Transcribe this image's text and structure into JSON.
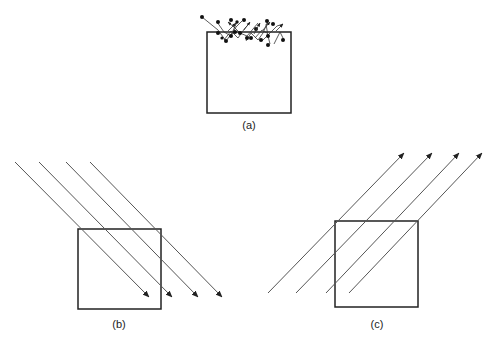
{
  "panels": [
    {
      "id": "a",
      "label": "(a)",
      "description": "particles scattering at the surface of a box"
    },
    {
      "id": "b",
      "label": "(b)",
      "description": "parallel rays entering the box from upper-left, pointing down-right"
    },
    {
      "id": "c",
      "label": "(c)",
      "description": "parallel rays emerging from the box toward upper-right"
    }
  ],
  "colors": {
    "stroke": "#222222",
    "ray": "#555555",
    "background": "#ffffff"
  }
}
